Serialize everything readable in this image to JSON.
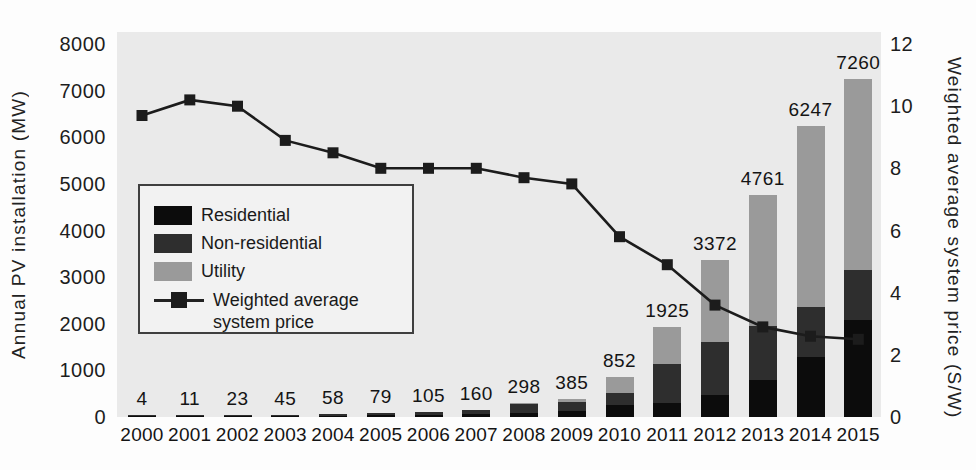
{
  "legend": {
    "line_label_line1": "Weighted average",
    "line_label_line2": "system price"
  },
  "chart_data": {
    "type": "bar",
    "subtype": "stacked-bars-with-dual-axis-line",
    "categories": [
      "2000",
      "2001",
      "2002",
      "2003",
      "2004",
      "2005",
      "2006",
      "2007",
      "2008",
      "2009",
      "2010",
      "2011",
      "2012",
      "2013",
      "2014",
      "2015"
    ],
    "series": [
      {
        "name": "Residential",
        "color": "#0c0c0c",
        "values": [
          2,
          5,
          10,
          20,
          26,
          35,
          45,
          60,
          80,
          130,
          250,
          290,
          472,
          800,
          1290,
          2075
        ]
      },
      {
        "name": "Non-residential",
        "color": "#2e2e2e",
        "values": [
          2,
          6,
          13,
          25,
          32,
          44,
          60,
          95,
          195,
          200,
          270,
          840,
          1129,
          1150,
          1075,
          1070
        ]
      },
      {
        "name": "Utility",
        "color": "#9a9a9a",
        "values": [
          0,
          0,
          0,
          0,
          0,
          0,
          0,
          5,
          23,
          55,
          332,
          795,
          1771,
          2811,
          3882,
          4115
        ]
      }
    ],
    "bar_totals": [
      4,
      11,
      23,
      45,
      58,
      79,
      105,
      160,
      298,
      385,
      852,
      1925,
      3372,
      4761,
      6247,
      7260
    ],
    "line_series": {
      "name": "Weighted average system price",
      "axis": "right",
      "color": "#1c1c1c",
      "marker": "square",
      "values": [
        9.7,
        10.2,
        10.0,
        8.9,
        8.5,
        8.0,
        8.0,
        8.0,
        7.7,
        7.5,
        5.8,
        4.9,
        3.6,
        2.9,
        2.6,
        2.5
      ]
    },
    "ylabel_left": "Annual PV installation (MW)",
    "ylabel_right": "Weighted average system price (S/W)",
    "ylim_left": [
      0,
      8000
    ],
    "ylim_right": [
      0,
      12
    ],
    "left_ticks": [
      0,
      1000,
      2000,
      3000,
      4000,
      5000,
      6000,
      7000,
      8000
    ],
    "right_ticks": [
      0,
      2,
      4,
      6,
      8,
      10,
      12
    ],
    "grid": false,
    "legend_position": "inside-upper-left",
    "plot_background": "#eaeaea"
  }
}
